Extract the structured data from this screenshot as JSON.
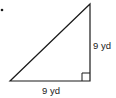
{
  "diagram": {
    "type": "right-triangle",
    "colors": {
      "stroke": "#1a1a1a",
      "background": "#ffffff"
    },
    "vertices": {
      "apex": [
        90,
        4
      ],
      "right_angle": [
        90,
        81
      ],
      "left": [
        10,
        81
      ]
    },
    "right_angle_marker_size": 8,
    "labels": {
      "vertical_leg": "9 yd",
      "horizontal_leg": "9 yd"
    },
    "bullet": "•"
  }
}
